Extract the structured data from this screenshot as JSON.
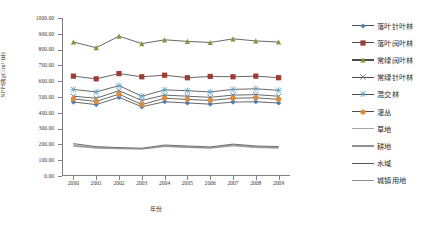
{
  "chart_data": {
    "type": "line",
    "title": "",
    "xlabel": "年份",
    "ylabel": "NPP值(gC/m²·年)",
    "x": [
      2000,
      2001,
      2002,
      2003,
      2004,
      2005,
      2006,
      2007,
      2008,
      2009
    ],
    "xticklabels": [
      "2000",
      "2001",
      "2002",
      "2003",
      "2004",
      "2005",
      "2006",
      "2007",
      "2008",
      "2009"
    ],
    "yticklabels": [
      "0.00",
      "100.00",
      "200.00",
      "300.00",
      "400.00",
      "500.00",
      "600.00",
      "700.00",
      "800.00",
      "900.00",
      "1000.00"
    ],
    "ylim": [
      0,
      1000
    ],
    "ytick_step": 100,
    "grid": false,
    "legend_position": "right",
    "series": [
      {
        "name": "落叶针叶林",
        "color": "#4a7ebb",
        "marker": "diamond",
        "values": [
          468,
          452,
          498,
          438,
          470,
          462,
          455,
          468,
          470,
          462
        ]
      },
      {
        "name": "落叶阔叶林",
        "color": "#9e3b32",
        "marker": "square",
        "values": [
          632,
          615,
          648,
          628,
          638,
          622,
          630,
          628,
          632,
          622
        ]
      },
      {
        "name": "常绿阔叶林",
        "color": "#7f993a",
        "marker": "triangle",
        "values": [
          848,
          812,
          885,
          838,
          862,
          852,
          845,
          868,
          855,
          848
        ]
      },
      {
        "name": "常绿针叶林",
        "color": "#6f7f8f",
        "marker": "xmark",
        "values": [
          505,
          492,
          540,
          478,
          512,
          505,
          498,
          512,
          515,
          505
        ]
      },
      {
        "name": "混交林",
        "color": "#59a5c9",
        "marker": "asterisk",
        "values": [
          548,
          532,
          572,
          505,
          545,
          540,
          532,
          548,
          552,
          542
        ]
      },
      {
        "name": "灌丛",
        "color": "#dd8c3c",
        "marker": "circle",
        "values": [
          488,
          472,
          518,
          452,
          492,
          485,
          478,
          492,
          495,
          485
        ]
      },
      {
        "name": "草地",
        "color": "#a6a6a6",
        "marker": "none",
        "values": [
          198,
          182,
          178,
          172,
          192,
          186,
          180,
          198,
          186,
          182
        ]
      },
      {
        "name": "耕地",
        "color": "#8f8f8f",
        "marker": "none",
        "values": [
          188,
          176,
          172,
          170,
          186,
          180,
          176,
          190,
          180,
          176
        ]
      },
      {
        "name": "水域",
        "color": "#585858",
        "marker": "none",
        "values": [
          205,
          186,
          180,
          176,
          196,
          190,
          184,
          202,
          190,
          186
        ]
      },
      {
        "name": "城镇用地",
        "color": "#909090",
        "marker": "none",
        "values": [
          192,
          180,
          175,
          173,
          189,
          183,
          178,
          195,
          183,
          179
        ]
      }
    ]
  }
}
